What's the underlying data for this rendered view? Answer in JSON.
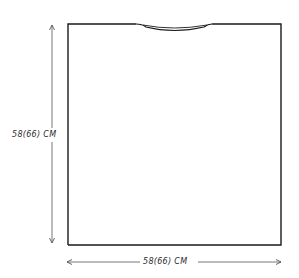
{
  "diagram": {
    "type": "garment-schematic",
    "piece": "body panel",
    "dimensions": {
      "height": {
        "label": "58(66) CM",
        "value_cm": 58,
        "alt_value_cm": 66,
        "orientation": "vertical"
      },
      "width": {
        "label": "58(66) CM",
        "value_cm": 58,
        "alt_value_cm": 66,
        "orientation": "horizontal"
      }
    },
    "features": {
      "neckline": "shallow curved neckline at top center"
    },
    "colors": {
      "line": "#1a1a1a",
      "arrow": "#555555",
      "background": "#ffffff"
    }
  }
}
